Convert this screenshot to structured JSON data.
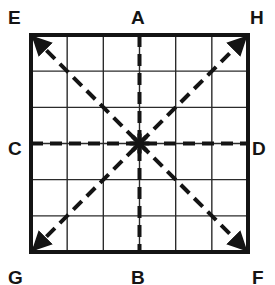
{
  "figure": {
    "background_color": "#ffffff",
    "ink_color": "#141414",
    "grid_line_color": "#2b2b2b",
    "border_color": "#141414",
    "square": {
      "left": 31,
      "top": 35,
      "size": 217,
      "divisions": 6,
      "border_width": 4,
      "grid_line_width": 1.4
    },
    "center_marker": {
      "name": "asterisk",
      "glyph": "*",
      "x": 139.5,
      "y": 143.5,
      "rays": 8
    },
    "dashed_lines": [
      {
        "name": "vertical-axis",
        "from": "A",
        "to": "B",
        "orientation": "vertical"
      },
      {
        "name": "horizontal-axis",
        "from": "C",
        "to": "D",
        "orientation": "horizontal"
      },
      {
        "name": "diagonal-e-f",
        "from": "E",
        "to": "F",
        "orientation": "diagonal-down"
      },
      {
        "name": "diagonal-g-h",
        "from": "G",
        "to": "H",
        "orientation": "diagonal-up"
      }
    ],
    "dash_pattern": "12 7",
    "dash_width": 4,
    "arrowheads": "double-ended",
    "labels": [
      {
        "id": "E",
        "text": "E",
        "position": "top-left"
      },
      {
        "id": "A",
        "text": "A",
        "position": "top-center"
      },
      {
        "id": "H",
        "text": "H",
        "position": "top-right"
      },
      {
        "id": "C",
        "text": "C",
        "position": "middle-left"
      },
      {
        "id": "D",
        "text": "D",
        "position": "middle-right"
      },
      {
        "id": "G",
        "text": "G",
        "position": "bottom-left"
      },
      {
        "id": "B",
        "text": "B",
        "position": "bottom-center"
      },
      {
        "id": "F",
        "text": "F",
        "position": "bottom-right"
      }
    ]
  }
}
